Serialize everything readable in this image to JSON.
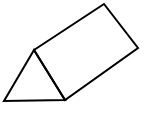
{
  "diagram": {
    "shape": "triangular-prism",
    "stroke_color": "#000000",
    "fill_color": "#ffffff",
    "stroke_width": 2,
    "vertices": {
      "triangle_apex": [
        34,
        50
      ],
      "triangle_bottom_left": [
        4,
        101
      ],
      "triangle_bottom_right": [
        65,
        100
      ],
      "back_top": [
        104,
        4
      ],
      "back_right": [
        138,
        48
      ]
    }
  }
}
